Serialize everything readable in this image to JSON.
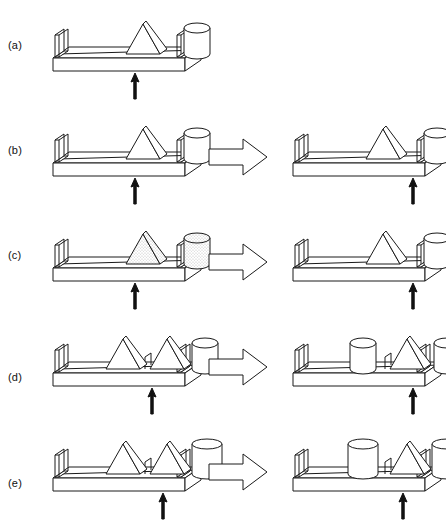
{
  "figure": {
    "background_color": "#ffffff",
    "line_color": "#1a1a1a",
    "fill_color": "#ffffff",
    "stipple_color": "#b8b8b8",
    "width": 446,
    "height": 524
  },
  "icons": {
    "transform_arrow": "right-block-arrow-icon",
    "fulcrum_arrow": "up-arrow-icon",
    "triangle": "triangle-prism-icon",
    "cylinder": "cylinder-icon",
    "tray": "tray-icon",
    "divider": "divider-icon"
  },
  "rows": [
    {
      "id": "a",
      "label": "(a)",
      "label_y": 40,
      "has_transform_arrow": false,
      "left": {
        "name": "panel-a-initial",
        "fulcrum_x": 90,
        "objects": [
          {
            "type": "triangle",
            "x": 98,
            "size": "medium",
            "shaded": false
          },
          {
            "type": "cylinder",
            "x": 152,
            "size": "medium",
            "shaded": false
          }
        ],
        "dividers": []
      },
      "right": null
    },
    {
      "id": "b",
      "label": "(b)",
      "label_y": 145,
      "has_transform_arrow": true,
      "left": {
        "name": "panel-b-initial",
        "fulcrum_x": 90,
        "objects": [
          {
            "type": "triangle",
            "x": 98,
            "size": "medium",
            "shaded": false
          },
          {
            "type": "cylinder",
            "x": 152,
            "size": "medium",
            "shaded": false
          }
        ],
        "dividers": []
      },
      "right": {
        "name": "panel-b-result",
        "fulcrum_x": 128,
        "objects": [
          {
            "type": "triangle",
            "x": 98,
            "size": "medium",
            "shaded": false
          },
          {
            "type": "cylinder",
            "x": 152,
            "size": "medium",
            "shaded": false
          }
        ],
        "dividers": []
      }
    },
    {
      "id": "c",
      "label": "(c)",
      "label_y": 250,
      "has_transform_arrow": true,
      "left": {
        "name": "panel-c-initial",
        "fulcrum_x": 90,
        "objects": [
          {
            "type": "triangle",
            "x": 98,
            "size": "medium",
            "shaded": true
          },
          {
            "type": "cylinder",
            "x": 152,
            "size": "medium",
            "shaded": true
          }
        ],
        "dividers": []
      },
      "right": {
        "name": "panel-c-result",
        "fulcrum_x": 128,
        "objects": [
          {
            "type": "triangle",
            "x": 98,
            "size": "medium",
            "shaded": false
          },
          {
            "type": "cylinder",
            "x": 152,
            "size": "medium",
            "shaded": false
          }
        ],
        "dividers": []
      }
    },
    {
      "id": "d",
      "label": "(d)",
      "label_y": 372,
      "has_transform_arrow": true,
      "left": {
        "name": "panel-d-initial",
        "fulcrum_x": 107,
        "objects": [
          {
            "type": "triangle",
            "x": 78,
            "size": "medium",
            "shaded": false
          },
          {
            "type": "triangle",
            "x": 122,
            "size": "medium",
            "shaded": false
          },
          {
            "type": "cylinder",
            "x": 160,
            "size": "medium",
            "shaded": false
          }
        ],
        "dividers": [
          100
        ]
      },
      "right": {
        "name": "panel-d-result",
        "fulcrum_x": 128,
        "objects": [
          {
            "type": "cylinder",
            "x": 78,
            "size": "medium",
            "shaded": false
          },
          {
            "type": "triangle",
            "x": 122,
            "size": "medium",
            "shaded": false
          },
          {
            "type": "cylinder",
            "x": 162,
            "size": "medium",
            "shaded": false
          }
        ],
        "dividers": [
          100
        ]
      }
    },
    {
      "id": "e",
      "label": "(e)",
      "label_y": 478,
      "has_transform_arrow": true,
      "left": {
        "name": "panel-e-initial",
        "fulcrum_x": 118,
        "objects": [
          {
            "type": "triangle",
            "x": 78,
            "size": "medium",
            "shaded": false
          },
          {
            "type": "triangle",
            "x": 122,
            "size": "medium",
            "shaded": false
          },
          {
            "type": "cylinder",
            "x": 162,
            "size": "large",
            "shaded": false
          }
        ],
        "dividers": [
          100
        ]
      },
      "right": {
        "name": "panel-e-result",
        "fulcrum_x": 118,
        "objects": [
          {
            "type": "cylinder",
            "x": 78,
            "size": "large",
            "shaded": false
          },
          {
            "type": "triangle",
            "x": 122,
            "size": "medium",
            "shaded": false
          },
          {
            "type": "cylinder",
            "x": 162,
            "size": "large",
            "shaded": false
          }
        ],
        "dividers": [
          100
        ]
      }
    }
  ],
  "layout": {
    "row_tops": [
      0,
      105,
      210,
      315,
      420
    ],
    "left_panel_x": 45,
    "arrow_cell_x": 205,
    "right_panel_x": 285
  }
}
